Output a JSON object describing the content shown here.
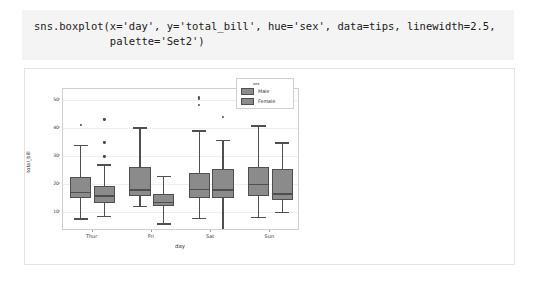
{
  "code_cell": {
    "source": "sns.boxplot(x='day', y='total_bill', hue='sex', data=tips, linewidth=2.5,\n            palette='Set2')"
  },
  "chart_data": {
    "type": "box",
    "title": "",
    "xlabel": "day",
    "ylabel": "total_bill",
    "categories": [
      "Thur",
      "Fri",
      "Sat",
      "Sun"
    ],
    "ylim": [
      3,
      54
    ],
    "yticks": [
      10,
      20,
      30,
      40,
      50
    ],
    "grid": true,
    "legend": {
      "title": "sex",
      "position": "upper right",
      "entries": [
        {
          "label": "Male",
          "color": "#8b8b8b"
        },
        {
          "label": "Female",
          "color": "#8b8b8b"
        }
      ]
    },
    "series": [
      {
        "name": "Male",
        "color": "#8b8b8b",
        "boxes": [
          {
            "category": "Thur",
            "whisker_low": 7.5,
            "q1": 15.0,
            "median": 17.0,
            "q3": 22.5,
            "whisker_high": 34.0,
            "fliers": [
              41.2
            ]
          },
          {
            "category": "Fri",
            "whisker_low": 12.0,
            "q1": 15.4,
            "median": 18.0,
            "q3": 26.0,
            "whisker_high": 40.2,
            "fliers": []
          },
          {
            "category": "Sat",
            "whisker_low": 7.8,
            "q1": 15.0,
            "median": 18.2,
            "q3": 24.0,
            "whisker_high": 39.2,
            "fliers": [
              48.2,
              50.4,
              51.0
            ]
          },
          {
            "category": "Sun",
            "whisker_low": 8.0,
            "q1": 15.4,
            "median": 20.0,
            "q3": 26.0,
            "whisker_high": 41.0,
            "fliers": []
          }
        ]
      },
      {
        "name": "Female",
        "color": "#8b8b8b",
        "boxes": [
          {
            "category": "Thur",
            "whisker_low": 8.4,
            "q1": 13.0,
            "median": 15.8,
            "q3": 19.0,
            "whisker_high": 27.0,
            "fliers": [
              29.8,
              34.8,
              43.1
            ]
          },
          {
            "category": "Fri",
            "whisker_low": 5.8,
            "q1": 11.8,
            "median": 13.4,
            "q3": 16.3,
            "whisker_high": 22.8,
            "fliers": []
          },
          {
            "category": "Sat",
            "whisker_low": 3.1,
            "q1": 15.0,
            "median": 18.0,
            "q3": 25.4,
            "whisker_high": 35.8,
            "fliers": [
              44.0
            ]
          },
          {
            "category": "Sun",
            "whisker_low": 9.8,
            "q1": 14.0,
            "median": 16.6,
            "q3": 25.4,
            "whisker_high": 34.9,
            "fliers": []
          }
        ]
      }
    ]
  }
}
